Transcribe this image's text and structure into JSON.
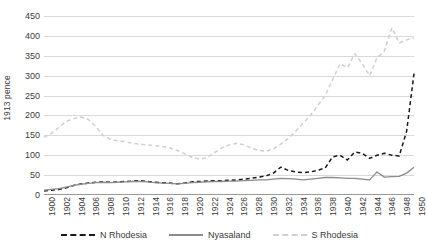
{
  "chart_data": {
    "type": "line",
    "title": "",
    "xlabel": "",
    "ylabel": "1913 pence",
    "xlim": [
      1900,
      1950
    ],
    "ylim": [
      0,
      450
    ],
    "ytick_step": 50,
    "xtick_step": 2,
    "grid": true,
    "legend_position": "bottom",
    "yticks": [
      "450",
      "400",
      "350",
      "300",
      "250",
      "200",
      "150",
      "100",
      "50",
      "0"
    ],
    "xticks": [
      "1900",
      "1902",
      "1904",
      "1906",
      "1908",
      "1910",
      "1912",
      "1914",
      "1916",
      "1918",
      "1920",
      "1922",
      "1924",
      "1926",
      "1928",
      "1930",
      "1932",
      "1934",
      "1936",
      "1938",
      "1940",
      "1942",
      "1944",
      "1946",
      "1948",
      "1950"
    ],
    "x": [
      1900,
      1901,
      1902,
      1903,
      1904,
      1905,
      1906,
      1907,
      1908,
      1909,
      1910,
      1911,
      1912,
      1913,
      1914,
      1915,
      1916,
      1917,
      1918,
      1919,
      1920,
      1921,
      1922,
      1923,
      1924,
      1925,
      1926,
      1927,
      1928,
      1929,
      1930,
      1931,
      1932,
      1933,
      1934,
      1935,
      1936,
      1937,
      1938,
      1939,
      1940,
      1941,
      1942,
      1943,
      1944,
      1945,
      1946,
      1947,
      1948,
      1949,
      1950
    ],
    "series": [
      {
        "name": "N Rhodesia",
        "color": "#1a1a1a",
        "style": "dashed",
        "values": [
          10,
          12,
          14,
          18,
          24,
          28,
          30,
          32,
          33,
          32,
          33,
          34,
          35,
          36,
          34,
          32,
          31,
          30,
          28,
          30,
          33,
          34,
          35,
          36,
          36,
          37,
          38,
          40,
          42,
          45,
          48,
          55,
          70,
          62,
          58,
          56,
          58,
          62,
          68,
          96,
          100,
          88,
          108,
          105,
          92,
          100,
          105,
          100,
          98,
          160,
          305
        ]
      },
      {
        "name": "Nyasaland",
        "color": "#8c8c8c",
        "style": "solid",
        "values": [
          12,
          14,
          16,
          20,
          24,
          27,
          29,
          31,
          32,
          31,
          32,
          33,
          34,
          34,
          33,
          31,
          30,
          29,
          28,
          29,
          31,
          32,
          33,
          34,
          34,
          35,
          35,
          36,
          37,
          38,
          38,
          40,
          42,
          41,
          40,
          38,
          40,
          42,
          44,
          44,
          43,
          42,
          42,
          40,
          38,
          58,
          45,
          46,
          47,
          55,
          70
        ]
      },
      {
        "name": "S Rhodesia",
        "color": "#cfcfcf",
        "style": "dashed",
        "values": [
          145,
          155,
          170,
          185,
          192,
          196,
          190,
          172,
          150,
          140,
          136,
          134,
          130,
          128,
          126,
          124,
          122,
          118,
          112,
          104,
          95,
          90,
          94,
          106,
          118,
          126,
          130,
          126,
          118,
          112,
          110,
          116,
          128,
          142,
          160,
          180,
          200,
          225,
          250,
          290,
          330,
          320,
          355,
          330,
          300,
          345,
          362,
          420,
          382,
          390,
          395
        ]
      }
    ]
  },
  "legend": {
    "items": [
      {
        "label": "N Rhodesia"
      },
      {
        "label": "Nyasaland"
      },
      {
        "label": "S Rhodesia"
      }
    ]
  }
}
